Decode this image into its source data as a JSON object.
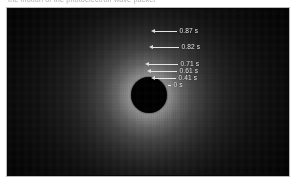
{
  "page": {
    "background_color": "#ffffff",
    "caption_sliver_text": "the motion of the photoelectron wave packet"
  },
  "figure": {
    "frame_border_color": "#b9b9bd",
    "background_color": "#050505",
    "glow_center_color": "#cdcdcd",
    "occulter": {
      "name": "occulting-disc",
      "color": "#000000",
      "center_x_pct": 50.2,
      "center_y_pct": 52,
      "radius_px": 18
    },
    "annotation_color": "#e9e9e9",
    "annotations": [
      {
        "label": "0.87 s",
        "top_px": 18,
        "left_px": 143,
        "leader_len_px": 22
      },
      {
        "label": "0.82 s",
        "top_px": 34,
        "left_px": 141,
        "leader_len_px": 26
      },
      {
        "label": "0.71 s",
        "top_px": 51,
        "left_px": 137,
        "leader_len_px": 29
      },
      {
        "label": "0.61 s",
        "top_px": 58,
        "left_px": 139,
        "leader_len_px": 26
      },
      {
        "label": "0.41 s",
        "top_px": 65,
        "left_px": 143,
        "leader_len_px": 21
      },
      {
        "label": "0 s",
        "top_px": 72,
        "left_px": 160,
        "leader_len_px": 3
      }
    ]
  },
  "chart_data": {
    "type": "scatter",
    "xlabel": "",
    "ylabel": "Radius (annotated position)",
    "legend_position": "inside-right",
    "grid": false,
    "annotations": [
      "0.87 s",
      "0.82 s",
      "0.71 s",
      "0.61 s",
      "0.41 s",
      "0 s"
    ],
    "categories": [
      "0 s",
      "0.41 s",
      "0.61 s",
      "0.71 s",
      "0.82 s",
      "0.87 s"
    ],
    "values": [
      0,
      0.41,
      0.61,
      0.71,
      0.82,
      0.87
    ],
    "series": [
      {
        "name": "elapsed time",
        "values": [
          0,
          0.41,
          0.61,
          0.71,
          0.82,
          0.87
        ]
      },
      {
        "name": "marker y-position (px from figure top)",
        "values": [
          76,
          69,
          62,
          55,
          38,
          22
        ]
      },
      {
        "name": "leader line length (px)",
        "values": [
          3,
          21,
          26,
          29,
          26,
          22
        ]
      }
    ],
    "ylim": [
      0,
      0.9
    ],
    "units": "s"
  }
}
